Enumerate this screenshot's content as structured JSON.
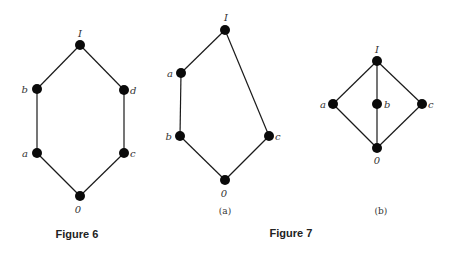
{
  "figure6": {
    "caption": "Figure 6",
    "nodes": [
      {
        "id": "I",
        "label": "I",
        "x": 80,
        "y": 45,
        "lx": 80,
        "ly": 37,
        "anchor": "middle"
      },
      {
        "id": "b",
        "label": "b",
        "x": 37,
        "y": 89,
        "lx": 28,
        "ly": 93,
        "anchor": "end"
      },
      {
        "id": "d",
        "label": "d",
        "x": 124,
        "y": 90,
        "lx": 130,
        "ly": 94,
        "anchor": "start"
      },
      {
        "id": "a",
        "label": "a",
        "x": 37,
        "y": 153,
        "lx": 28,
        "ly": 157,
        "anchor": "end"
      },
      {
        "id": "c",
        "label": "c",
        "x": 124,
        "y": 153,
        "lx": 130,
        "ly": 157,
        "anchor": "start"
      },
      {
        "id": "0",
        "label": "0",
        "x": 80,
        "y": 196,
        "lx": 78,
        "ly": 213,
        "anchor": "middle"
      }
    ],
    "edges": [
      [
        "I",
        "b"
      ],
      [
        "I",
        "d"
      ],
      [
        "b",
        "a"
      ],
      [
        "d",
        "c"
      ],
      [
        "a",
        "0"
      ],
      [
        "c",
        "0"
      ]
    ]
  },
  "figure7": {
    "caption": "Figure 7",
    "a": {
      "sublabel": "(a)",
      "nodes": [
        {
          "id": "I",
          "label": "I",
          "x": 225,
          "y": 30,
          "lx": 226,
          "ly": 21,
          "anchor": "middle"
        },
        {
          "id": "a",
          "label": "a",
          "x": 181,
          "y": 73,
          "lx": 173,
          "ly": 77,
          "anchor": "end"
        },
        {
          "id": "b",
          "label": "b",
          "x": 180,
          "y": 136,
          "lx": 172,
          "ly": 140,
          "anchor": "end"
        },
        {
          "id": "c",
          "label": "c",
          "x": 269,
          "y": 136,
          "lx": 275,
          "ly": 140,
          "anchor": "start"
        },
        {
          "id": "0",
          "label": "0",
          "x": 225,
          "y": 180,
          "lx": 224,
          "ly": 197,
          "anchor": "middle"
        }
      ],
      "edges": [
        [
          "I",
          "a"
        ],
        [
          "a",
          "b"
        ],
        [
          "b",
          "0"
        ],
        [
          "I",
          "c"
        ],
        [
          "c",
          "0"
        ]
      ]
    },
    "b": {
      "sublabel": "(b)",
      "nodes": [
        {
          "id": "I",
          "label": "I",
          "x": 377,
          "y": 61,
          "lx": 377,
          "ly": 53,
          "anchor": "middle"
        },
        {
          "id": "a",
          "label": "a",
          "x": 333,
          "y": 104,
          "lx": 326,
          "ly": 108,
          "anchor": "end"
        },
        {
          "id": "b",
          "label": "b",
          "x": 377,
          "y": 104,
          "lx": 384,
          "ly": 108,
          "anchor": "start"
        },
        {
          "id": "c",
          "label": "c",
          "x": 422,
          "y": 104,
          "lx": 428,
          "ly": 108,
          "anchor": "start"
        },
        {
          "id": "0",
          "label": "0",
          "x": 377,
          "y": 148,
          "lx": 377,
          "ly": 164,
          "anchor": "middle"
        }
      ],
      "edges": [
        [
          "I",
          "a"
        ],
        [
          "I",
          "b"
        ],
        [
          "I",
          "c"
        ],
        [
          "a",
          "0"
        ],
        [
          "b",
          "0"
        ],
        [
          "c",
          "0"
        ]
      ]
    }
  }
}
